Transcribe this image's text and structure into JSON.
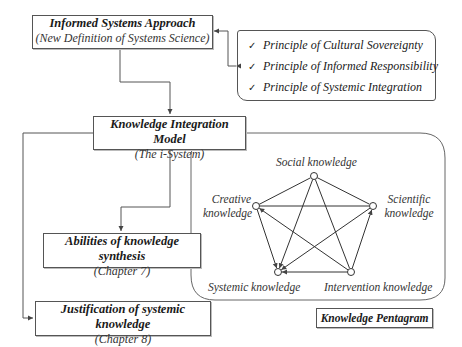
{
  "diagram": {
    "top_box": {
      "title": "Informed Systems Approach",
      "subtitle": "(New Definition of Systems Science)"
    },
    "principles": [
      {
        "check": "✓",
        "label": "Principle of Cultural Sovereignty"
      },
      {
        "check": "✓",
        "label": "Principle of Informed Responsibility"
      },
      {
        "check": "✓",
        "label": "Principle of Systemic Integration"
      }
    ],
    "model_box": {
      "title": "Knowledge Integration Model",
      "subtitle": "(The i-System)"
    },
    "abilities_box": {
      "title": "Abilities of knowledge synthesis",
      "subtitle": "(Chapter 7)"
    },
    "justification_box": {
      "title": "Justification of systemic knowledge",
      "subtitle": "(Chapter 8)"
    },
    "pentagram": {
      "label": "Knowledge Pentagram",
      "nodes": {
        "social": "Social knowledge",
        "creative_line1": "Creative",
        "creative_line2": "knowledge",
        "scientific_line1": "Scientific",
        "scientific_line2": "knowledge",
        "systemic": "Systemic knowledge",
        "intervention": "Intervention knowledge"
      }
    }
  }
}
